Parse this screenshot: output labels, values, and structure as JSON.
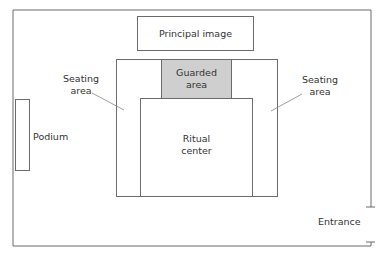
{
  "diagram": {
    "type": "floor-plan",
    "labels": {
      "principal_image": "Principal image",
      "guarded_area_line1": "Guarded",
      "guarded_area_line2": "area",
      "ritual_center_line1": "Ritual",
      "ritual_center_line2": "center",
      "seating_left_line1": "Seating",
      "seating_left_line2": "area",
      "seating_right_line1": "Seating",
      "seating_right_line2": "area",
      "podium": "Podium",
      "entrance": "Entrance"
    },
    "colors": {
      "stroke": "#6b6b6b",
      "guarded_fill": "#cfcfcf",
      "background": "#ffffff"
    }
  }
}
